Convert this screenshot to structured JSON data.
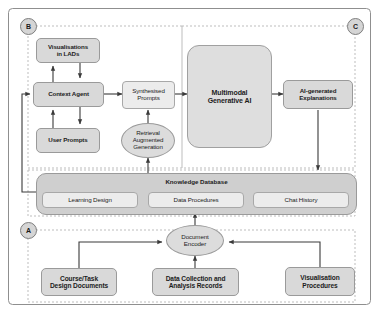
{
  "diagram": {
    "regions": [
      {
        "id": "A",
        "label": "A",
        "name": "data-ingestion-region"
      },
      {
        "id": "B",
        "label": "B",
        "name": "context-agent-region"
      },
      {
        "id": "C",
        "label": "C",
        "name": "explanation-output-region"
      }
    ],
    "nodes": {
      "visualisations_in_lads": {
        "line1": "Visualisations",
        "line2": "in LADs"
      },
      "context_agent": {
        "line1": "Context Agent"
      },
      "user_prompts": {
        "line1": "User Prompts"
      },
      "synthesised_prompts": {
        "line1": "Synthesised",
        "line2": "Prompts"
      },
      "retrieval_augmented_generation": {
        "line1": "Retrieval",
        "line2": "Augmented",
        "line3": "Generation"
      },
      "multimodal_generative_ai": {
        "line1": "Multimodal",
        "line2": "Generative AI"
      },
      "ai_generated_explanations": {
        "line1": "AI-generated",
        "line2": "Explanations"
      },
      "knowledge_database": {
        "title": "Knowledge Database"
      },
      "learning_design": {
        "line1": "Learning Design"
      },
      "data_procedures": {
        "line1": "Data Procedures"
      },
      "chat_history": {
        "line1": "Chat History"
      },
      "document_encoder": {
        "line1": "Document",
        "line2": "Encoder"
      },
      "course_task_design_documents": {
        "line1": "Course/Task",
        "line2": "Design Documents"
      },
      "data_collection_analysis_records": {
        "line1": "Data Collection and",
        "line2": "Analysis Records"
      },
      "visualisation_procedures": {
        "line1": "Visualisation",
        "line2": "Procedures"
      }
    },
    "colors": {
      "node_fill": "#d9d9d9",
      "node_fill_light": "#ececec",
      "node_fill_big": "#dedede",
      "database_fill": "#cfcfcf",
      "stroke": "#9a9a9a",
      "connector": "#3a3a3a",
      "region_dash": "#b9b9b9",
      "outer_border": "#8f8f8f"
    }
  }
}
